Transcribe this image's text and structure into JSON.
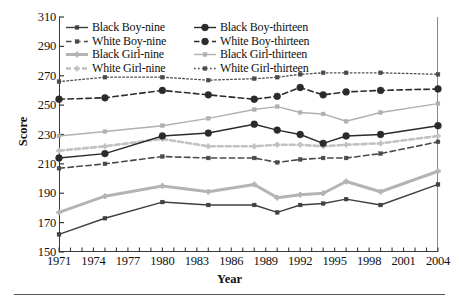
{
  "figure": {
    "background": "#ffffff",
    "frame_color": "#3a3a3a"
  },
  "chart_data": {
    "type": "line",
    "title": "",
    "xlabel": "Year",
    "ylabel": "Score",
    "xlim": [
      1971,
      2004
    ],
    "ylim": [
      150,
      310
    ],
    "ytick_step": 20,
    "yticks": [
      150,
      170,
      190,
      210,
      230,
      250,
      270,
      290,
      310
    ],
    "xticks_major": [
      1971,
      1974,
      1977,
      1980,
      1983,
      1986,
      1989,
      1992,
      1995,
      1998,
      2001,
      2004
    ],
    "xticks_minor_every": 1,
    "grid": false,
    "legend_position": "upper-left-inside",
    "x": [
      1971,
      1975,
      1980,
      1984,
      1988,
      1990,
      1992,
      1994,
      1996,
      1999,
      2004
    ],
    "series": [
      {
        "name": "Black Boy-nine",
        "color": "#3f3f3f",
        "linestyle": "solid",
        "marker": "square",
        "linewidth": 1.4,
        "values": [
          162,
          173,
          184,
          182,
          182,
          177,
          182,
          183,
          186,
          182,
          196
        ]
      },
      {
        "name": "White Boy-nine",
        "color": "#4a4a4a",
        "linestyle": "dashed",
        "marker": "square",
        "linewidth": 1.6,
        "values": [
          207,
          210,
          215,
          214,
          214,
          211,
          213,
          214,
          214,
          217,
          225
        ]
      },
      {
        "name": "Black Girl-nine",
        "color": "#b4b4b4",
        "linestyle": "solid",
        "marker": "plus",
        "linewidth": 3.0,
        "values": [
          177,
          188,
          195,
          191,
          196,
          187,
          189,
          190,
          198,
          191,
          205
        ]
      },
      {
        "name": "White Girl-nine",
        "color": "#c2c2c2",
        "linestyle": "dashed",
        "marker": "plus",
        "linewidth": 2.6,
        "values": [
          219,
          222,
          227,
          222,
          222,
          223,
          223,
          222,
          223,
          224,
          229
        ]
      },
      {
        "name": "Black Boy-thirteen",
        "color": "#2b2b2b",
        "linestyle": "solid",
        "marker": "circle",
        "linewidth": 1.4,
        "values": [
          214,
          217,
          229,
          231,
          237,
          233,
          230,
          224,
          229,
          230,
          236
        ]
      },
      {
        "name": "White Boy-thirteen",
        "color": "#2b2b2b",
        "linestyle": "dashed",
        "marker": "circle",
        "linewidth": 1.6,
        "values": [
          254,
          255,
          260,
          257,
          254,
          256,
          262,
          257,
          259,
          260,
          261
        ]
      },
      {
        "name": "Black Girl-thirteen",
        "color": "#b0b0b0",
        "linestyle": "solid",
        "marker": "square",
        "linewidth": 1.4,
        "values": [
          229,
          232,
          236,
          241,
          247,
          249,
          245,
          244,
          239,
          245,
          251
        ]
      },
      {
        "name": "White Girl-thirteen",
        "color": "#4a4a4a",
        "linestyle": "dotted",
        "marker": "square",
        "linewidth": 1.3,
        "values": [
          266,
          269,
          269,
          267,
          268,
          269,
          271,
          272,
          272,
          272,
          271
        ]
      }
    ]
  },
  "legend": {
    "entries": [
      {
        "label": "Black Boy-nine",
        "series": 0,
        "column": "left"
      },
      {
        "label": "White Boy-nine",
        "series": 1,
        "column": "left"
      },
      {
        "label": "Black Girl-nine",
        "series": 2,
        "column": "left"
      },
      {
        "label": "White Girl-nine",
        "series": 3,
        "column": "left"
      },
      {
        "label": "Black Boy-thirteen",
        "series": 4,
        "column": "right"
      },
      {
        "label": "White Boy-thirteen",
        "series": 5,
        "column": "right"
      },
      {
        "label": "Black Girl-thirteen",
        "series": 6,
        "column": "right"
      },
      {
        "label": "White Girl-thirteen",
        "series": 7,
        "column": "right"
      }
    ]
  },
  "axes": {
    "y_title": "Score",
    "x_title": "Year"
  }
}
